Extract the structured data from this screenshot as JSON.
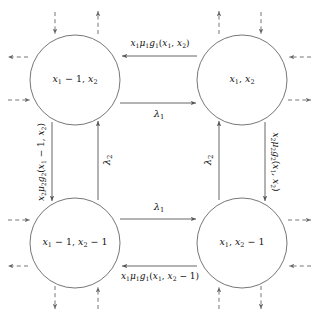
{
  "figure": {
    "type": "state-transition-diagram",
    "background_color": "#ffffff",
    "stroke_color": "#555555",
    "text_color": "#111111"
  },
  "nodes": [
    {
      "id": "tl",
      "label": "x1 - 1, x2",
      "label_html": "<i>x</i><span class=\"sub\">1</span> &#8722; 1, <i>x</i><span class=\"sub\">2</span>",
      "cx": 75,
      "cy": 80,
      "r": 45
    },
    {
      "id": "tr",
      "label": "x1, x2",
      "label_html": "<i>x</i><span class=\"sub\">1</span>, <i>x</i><span class=\"sub\">2</span>",
      "cx": 242,
      "cy": 80,
      "r": 45
    },
    {
      "id": "bl",
      "label": "x1 - 1, x2 - 1",
      "label_html": "<i>x</i><span class=\"sub\">1</span> &#8722; 1, <i>x</i><span class=\"sub\">2</span> &#8722; 1",
      "cx": 75,
      "cy": 243,
      "r": 45
    },
    {
      "id": "br",
      "label": "x1, x2 - 1",
      "label_html": "<i>x</i><span class=\"sub\">1</span>, <i>x</i><span class=\"sub\">2</span> &#8722; 1",
      "cx": 242,
      "cy": 243,
      "r": 45
    }
  ],
  "edges": [
    {
      "id": "top-left-arrow",
      "from": "tr",
      "to": "tl",
      "label": "x1 mu1 g1(x1, x2)",
      "label_html": "<i>x</i><span class=\"sub\">1</span><i>&#956;</i><span class=\"sub\">1</span><i>g</i><span class=\"sub\">1</span>(<i>x</i><span class=\"sub\">1</span>, <i>x</i><span class=\"sub\">2</span>)",
      "direction": "leftward",
      "style": "solid"
    },
    {
      "id": "top-right-arrow",
      "from": "tl",
      "to": "tr",
      "label": "lambda1",
      "label_html": "<i>&#955;</i><span class=\"sub\">1</span>",
      "direction": "rightward",
      "style": "solid"
    },
    {
      "id": "bottom-right-arrow",
      "from": "bl",
      "to": "br",
      "label": "lambda1",
      "label_html": "<i>&#955;</i><span class=\"sub\">1</span>",
      "direction": "rightward",
      "style": "solid"
    },
    {
      "id": "bottom-left-arrow",
      "from": "br",
      "to": "bl",
      "label": "x1 mu1 g1(x1, x2 - 1)",
      "label_html": "<i>x</i><span class=\"sub\">1</span><i>&#956;</i><span class=\"sub\">1</span><i>g</i><span class=\"sub\">1</span>(<i>x</i><span class=\"sub\">1</span>, <i>x</i><span class=\"sub\">2</span> &#8722; 1)",
      "direction": "leftward",
      "style": "solid"
    },
    {
      "id": "left-down-arrow",
      "from": "tl",
      "to": "bl",
      "label": "x2 mu2 g2(x1 - 1, x2)",
      "label_html": "<i>x</i><span class=\"sub\">2</span><i>&#956;</i><span class=\"sub\">2</span><i>g</i><span class=\"sub\">2</span>(<i>x</i><span class=\"sub\">1</span> &#8722; 1, <i>x</i><span class=\"sub\">2</span>)",
      "direction": "downward",
      "style": "solid"
    },
    {
      "id": "left-up-arrow",
      "from": "bl",
      "to": "tl",
      "label": "lambda2",
      "label_html": "<i>&#955;</i><span class=\"sub\">2</span>",
      "direction": "upward",
      "style": "solid"
    },
    {
      "id": "right-up-arrow",
      "from": "br",
      "to": "tr",
      "label": "lambda2",
      "label_html": "<i>&#955;</i><span class=\"sub\">2</span>",
      "direction": "upward",
      "style": "solid"
    },
    {
      "id": "right-down-arrow",
      "from": "tr",
      "to": "br",
      "label": "x2 mu2 g2(x1, x2)",
      "label_html": "<i>x</i><span class=\"sub\">2</span><i>&#956;</i><span class=\"sub\">2</span><i>g</i><span class=\"sub\">2</span>(<i>x</i><span class=\"sub\">1</span>, <i>x</i><span class=\"sub\">2</span>)",
      "direction": "downward",
      "style": "solid"
    }
  ],
  "boundary_arrows": [
    {
      "id": "tl-out-left",
      "node": "tl",
      "side": "left",
      "direction": "out",
      "style": "dashed"
    },
    {
      "id": "tl-in-left",
      "node": "tl",
      "side": "left",
      "direction": "in",
      "style": "dashed"
    },
    {
      "id": "tl-in-top",
      "node": "tl",
      "side": "top",
      "direction": "in",
      "style": "dashed"
    },
    {
      "id": "tl-out-top",
      "node": "tl",
      "side": "top",
      "direction": "out",
      "style": "dashed"
    },
    {
      "id": "tr-out-top",
      "node": "tr",
      "side": "top",
      "direction": "out",
      "style": "dashed"
    },
    {
      "id": "tr-in-top",
      "node": "tr",
      "side": "top",
      "direction": "in",
      "style": "dashed"
    },
    {
      "id": "tr-in-right",
      "node": "tr",
      "side": "right",
      "direction": "in",
      "style": "dashed"
    },
    {
      "id": "tr-out-right",
      "node": "tr",
      "side": "right",
      "direction": "out",
      "style": "dashed"
    },
    {
      "id": "bl-in-left",
      "node": "bl",
      "side": "left",
      "direction": "in",
      "style": "dashed"
    },
    {
      "id": "bl-out-left",
      "node": "bl",
      "side": "left",
      "direction": "out",
      "style": "dashed"
    },
    {
      "id": "bl-out-bottom",
      "node": "bl",
      "side": "bottom",
      "direction": "out",
      "style": "dashed"
    },
    {
      "id": "bl-in-bottom",
      "node": "bl",
      "side": "bottom",
      "direction": "in",
      "style": "dashed"
    },
    {
      "id": "br-out-bottom",
      "node": "br",
      "side": "bottom",
      "direction": "out",
      "style": "dashed"
    },
    {
      "id": "br-in-bottom",
      "node": "br",
      "side": "bottom",
      "direction": "in",
      "style": "dashed"
    },
    {
      "id": "br-in-right",
      "node": "br",
      "side": "right",
      "direction": "in",
      "style": "dashed"
    },
    {
      "id": "br-out-right",
      "node": "br",
      "side": "right",
      "direction": "out",
      "style": "dashed"
    }
  ]
}
